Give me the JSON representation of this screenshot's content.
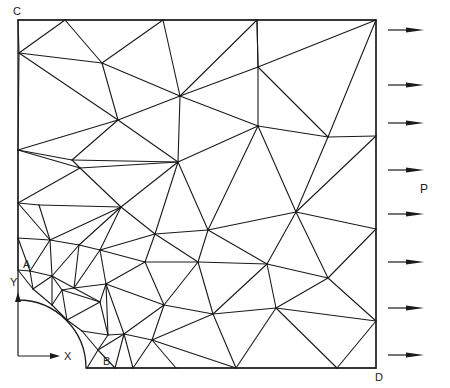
{
  "figure": {
    "title": ""
  },
  "labels": {
    "corner_top_left": "C",
    "corner_bottom_right": "D",
    "hole_point_top": "A",
    "hole_point_right": "B",
    "load": "P",
    "axis_x": "X",
    "axis_y": "Y"
  },
  "load": {
    "arrow_count": 8,
    "direction": "right",
    "arrows_y": [
      30,
      85,
      123,
      170,
      214,
      262,
      308,
      355
    ]
  },
  "geometry": {
    "plate": {
      "x1": 18,
      "y1": 20,
      "x2": 376,
      "y2": 368
    },
    "hole": {
      "cx": 18,
      "cy": 368,
      "r": 68
    }
  },
  "colors": {
    "line": "#1a1a1a",
    "background": "#ffffff"
  },
  "nodes": {
    "N1": [
      18,
      20
    ],
    "N2": [
      65,
      20
    ],
    "N3": [
      163,
      20
    ],
    "N4": [
      257,
      20
    ],
    "N5": [
      376,
      20
    ],
    "N6": [
      19,
      53
    ],
    "N7": [
      102,
      63
    ],
    "N8": [
      180,
      96
    ],
    "N9": [
      258,
      67
    ],
    "N10": [
      376,
      136
    ],
    "N11": [
      18,
      150
    ],
    "N12": [
      72,
      160
    ],
    "N13": [
      118,
      120
    ],
    "N14": [
      178,
      162
    ],
    "N15": [
      258,
      126
    ],
    "N16": [
      328,
      137
    ],
    "N17": [
      18,
      203
    ],
    "N18": [
      39,
      205
    ],
    "N19": [
      80,
      168
    ],
    "N20": [
      121,
      207
    ],
    "N21": [
      155,
      234
    ],
    "N22": [
      208,
      230
    ],
    "N23": [
      296,
      212
    ],
    "N24": [
      376,
      229
    ],
    "N25": [
      18,
      238
    ],
    "N26": [
      50,
      240
    ],
    "N27": [
      79,
      245
    ],
    "N28": [
      100,
      250
    ],
    "N29": [
      145,
      262
    ],
    "N30": [
      198,
      262
    ],
    "N31": [
      267,
      264
    ],
    "N32": [
      328,
      278
    ],
    "N33": [
      18,
      270
    ],
    "N34": [
      30,
      271
    ],
    "N35": [
      52,
      276
    ],
    "N36": [
      74,
      288
    ],
    "N37": [
      106,
      284
    ],
    "N38": [
      164,
      305
    ],
    "N39": [
      213,
      314
    ],
    "N40": [
      276,
      308
    ],
    "N41": [
      376,
      321
    ],
    "N42": [
      33,
      289
    ],
    "N43": [
      52,
      305
    ],
    "N44": [
      67,
      320
    ],
    "N45": [
      82,
      331
    ],
    "N46": [
      98,
      350
    ],
    "N47": [
      87,
      368
    ],
    "N48": [
      108,
      335
    ],
    "N49": [
      124,
      334
    ],
    "N50": [
      152,
      340
    ],
    "N51": [
      176,
      368
    ],
    "N52": [
      236,
      368
    ],
    "N53": [
      337,
      368
    ],
    "N54": [
      376,
      368
    ],
    "N55": [
      62,
      290
    ],
    "N56": [
      115,
      368
    ],
    "N57": [
      133,
      368
    ],
    "N58": [
      100,
      302
    ]
  },
  "edges": [
    [
      "N1",
      "N2"
    ],
    [
      "N2",
      "N3"
    ],
    [
      "N3",
      "N4"
    ],
    [
      "N4",
      "N5"
    ],
    [
      "N1",
      "N6"
    ],
    [
      "N6",
      "N11"
    ],
    [
      "N11",
      "N17"
    ],
    [
      "N17",
      "N25"
    ],
    [
      "N25",
      "N33"
    ],
    [
      "N5",
      "N10"
    ],
    [
      "N10",
      "N24"
    ],
    [
      "N24",
      "N41"
    ],
    [
      "N41",
      "N54"
    ],
    [
      "N47",
      "N56"
    ],
    [
      "N56",
      "N57"
    ],
    [
      "N57",
      "N51"
    ],
    [
      "N51",
      "N52"
    ],
    [
      "N52",
      "N53"
    ],
    [
      "N53",
      "N54"
    ],
    [
      "N6",
      "N2"
    ],
    [
      "N2",
      "N7"
    ],
    [
      "N6",
      "N7"
    ],
    [
      "N7",
      "N3"
    ],
    [
      "N3",
      "N8"
    ],
    [
      "N7",
      "N8"
    ],
    [
      "N8",
      "N9"
    ],
    [
      "N9",
      "N4"
    ],
    [
      "N4",
      "N9"
    ],
    [
      "N9",
      "N5"
    ],
    [
      "N8",
      "N4"
    ],
    [
      "N6",
      "N13"
    ],
    [
      "N7",
      "N13"
    ],
    [
      "N11",
      "N13"
    ],
    [
      "N13",
      "N8"
    ],
    [
      "N13",
      "N14"
    ],
    [
      "N8",
      "N14"
    ],
    [
      "N8",
      "N15"
    ],
    [
      "N15",
      "N9"
    ],
    [
      "N15",
      "N16"
    ],
    [
      "N9",
      "N16"
    ],
    [
      "N16",
      "N5"
    ],
    [
      "N16",
      "N10"
    ],
    [
      "N11",
      "N12"
    ],
    [
      "N12",
      "N13"
    ],
    [
      "N12",
      "N14"
    ],
    [
      "N14",
      "N15"
    ],
    [
      "N15",
      "N23"
    ],
    [
      "N16",
      "N23"
    ],
    [
      "N23",
      "N24"
    ],
    [
      "N14",
      "N22"
    ],
    [
      "N22",
      "N15"
    ],
    [
      "N23",
      "N10"
    ],
    [
      "N11",
      "N19"
    ],
    [
      "N19",
      "N14"
    ],
    [
      "N12",
      "N19"
    ],
    [
      "N17",
      "N19"
    ],
    [
      "N19",
      "N20"
    ],
    [
      "N20",
      "N14"
    ],
    [
      "N20",
      "N21"
    ],
    [
      "N21",
      "N14"
    ],
    [
      "N21",
      "N22"
    ],
    [
      "N22",
      "N23"
    ],
    [
      "N22",
      "N31"
    ],
    [
      "N23",
      "N31"
    ],
    [
      "N31",
      "N32"
    ],
    [
      "N32",
      "N24"
    ],
    [
      "N23",
      "N32"
    ],
    [
      "N17",
      "N18"
    ],
    [
      "N18",
      "N20"
    ],
    [
      "N18",
      "N26"
    ],
    [
      "N17",
      "N26"
    ],
    [
      "N26",
      "N20"
    ],
    [
      "N26",
      "N27"
    ],
    [
      "N27",
      "N20"
    ],
    [
      "N27",
      "N28"
    ],
    [
      "N28",
      "N20"
    ],
    [
      "N28",
      "N21"
    ],
    [
      "N28",
      "N29"
    ],
    [
      "N29",
      "N21"
    ],
    [
      "N29",
      "N30"
    ],
    [
      "N30",
      "N21"
    ],
    [
      "N30",
      "N22"
    ],
    [
      "N30",
      "N31"
    ],
    [
      "N30",
      "N39"
    ],
    [
      "N31",
      "N39"
    ],
    [
      "N31",
      "N40"
    ],
    [
      "N39",
      "N40"
    ],
    [
      "N40",
      "N32"
    ],
    [
      "N32",
      "N41"
    ],
    [
      "N40",
      "N41"
    ],
    [
      "N25",
      "N26"
    ],
    [
      "N25",
      "N34"
    ],
    [
      "N26",
      "N34"
    ],
    [
      "N26",
      "N35"
    ],
    [
      "N34",
      "N35"
    ],
    [
      "N35",
      "N27"
    ],
    [
      "N35",
      "N36"
    ],
    [
      "N36",
      "N27"
    ],
    [
      "N36",
      "N28"
    ],
    [
      "N36",
      "N37"
    ],
    [
      "N37",
      "N28"
    ],
    [
      "N37",
      "N29"
    ],
    [
      "N37",
      "N38"
    ],
    [
      "N38",
      "N29"
    ],
    [
      "N38",
      "N30"
    ],
    [
      "N38",
      "N39"
    ],
    [
      "N33",
      "N34"
    ],
    [
      "N34",
      "N42"
    ],
    [
      "N33",
      "N42"
    ],
    [
      "N42",
      "N35"
    ],
    [
      "N42",
      "N43"
    ],
    [
      "N43",
      "N35"
    ],
    [
      "N43",
      "N55"
    ],
    [
      "N55",
      "N35"
    ],
    [
      "N55",
      "N36"
    ],
    [
      "N55",
      "N44"
    ],
    [
      "N43",
      "N44"
    ],
    [
      "N44",
      "N58"
    ],
    [
      "N55",
      "N58"
    ],
    [
      "N58",
      "N36"
    ],
    [
      "N58",
      "N37"
    ],
    [
      "N58",
      "N48"
    ],
    [
      "N44",
      "N45"
    ],
    [
      "N45",
      "N48"
    ],
    [
      "N48",
      "N37"
    ],
    [
      "N48",
      "N49"
    ],
    [
      "N49",
      "N37"
    ],
    [
      "N49",
      "N38"
    ],
    [
      "N49",
      "N50"
    ],
    [
      "N50",
      "N38"
    ],
    [
      "N50",
      "N39"
    ],
    [
      "N50",
      "N52"
    ],
    [
      "N39",
      "N52"
    ],
    [
      "N40",
      "N52"
    ],
    [
      "N40",
      "N53"
    ],
    [
      "N41",
      "N53"
    ],
    [
      "N45",
      "N46"
    ],
    [
      "N46",
      "N48"
    ],
    [
      "N46",
      "N47"
    ],
    [
      "N46",
      "N56"
    ],
    [
      "N46",
      "N49"
    ],
    [
      "N56",
      "N49"
    ],
    [
      "N49",
      "N57"
    ],
    [
      "N57",
      "N50"
    ],
    [
      "N50",
      "N51"
    ]
  ],
  "hole_arc_nodes": [
    "N33",
    "N42",
    "N43",
    "N44",
    "N45",
    "N46",
    "N47"
  ]
}
